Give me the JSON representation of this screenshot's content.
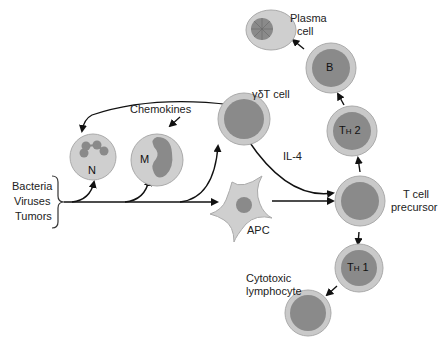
{
  "diagram": {
    "inputs": [
      "Bacteria",
      "Viruses",
      "Tumors"
    ],
    "labels": {
      "chemokines": "Chemokines",
      "gdt_cell": "γδT cell",
      "il4": "IL-4",
      "apc": "APC",
      "t_cell_precursor_line1": "T cell",
      "t_cell_precursor_line2": "precursor",
      "plasma_line1": "Plasma",
      "plasma_line2": "cell",
      "cytotoxic_line1": "Cytotoxic",
      "cytotoxic_line2": "lymphocyte"
    },
    "cells": {
      "neutrophil": "N",
      "macrophage": "M",
      "b_cell": "B",
      "th2_main": "T",
      "th2_sub": "H",
      "th2_num": "2",
      "th1_main": "T",
      "th1_sub": "H",
      "th1_num": "1"
    },
    "colors": {
      "outer_ring": "#c9c9c9",
      "inner_dark": "#8a8a8a",
      "light_cell": "#cfcfcf",
      "arrow": "#111111"
    }
  }
}
